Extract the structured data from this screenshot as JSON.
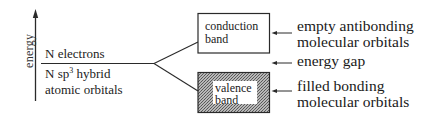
{
  "axis": {
    "label": "energy",
    "direction": "up"
  },
  "left_level": {
    "above_label": "N electrons",
    "below_label_line1_prefix": "N sp",
    "below_label_line1_sup": "3",
    "below_label_line1_suffix": " hybrid",
    "below_label_line2": "atomic orbitals"
  },
  "bands": {
    "conduction": {
      "line1": "conduction",
      "line2": "band",
      "fill": "#ffffff",
      "annotation_line1": "empty antibonding",
      "annotation_line2": "molecular orbitals"
    },
    "gap": {
      "annotation": "energy gap"
    },
    "valence": {
      "line1": "valence",
      "line2": "band",
      "fill": "hatched gray",
      "annotation_line1": "filled bonding",
      "annotation_line2": "molecular orbitals"
    }
  },
  "colors": {
    "line": "#2a2a2a",
    "hatch_dark": "#6e6e6e",
    "hatch_light": "#bdbdbd"
  }
}
